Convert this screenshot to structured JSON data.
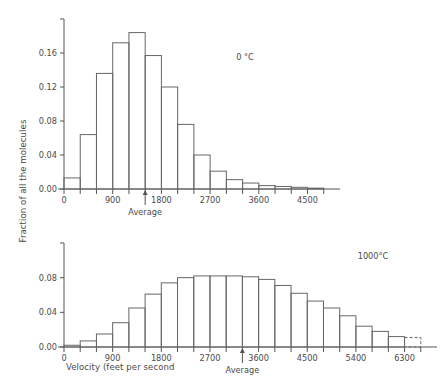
{
  "figure": {
    "ylabel": "Fraction of all the molecules",
    "xlabel": "Velocity (feet per second",
    "axis_color": "#555555",
    "bar_color": "#666666",
    "background": "#ffffff"
  },
  "chart_data": [
    {
      "type": "bar",
      "title": "",
      "annotation": "0 °C",
      "xlabel": "",
      "ylabel": "Fraction of all the molecules",
      "bin_width": 300,
      "xlim": [
        0,
        5100
      ],
      "ylim": [
        0,
        0.2
      ],
      "grid": false,
      "xticks": [
        0,
        900,
        1800,
        2700,
        3600,
        4500
      ],
      "xtick_labels": [
        "0",
        "900",
        "1800",
        "2700",
        "3600",
        "4500"
      ],
      "xminor_ticks": [
        300,
        600,
        1200,
        1500,
        2100,
        2400,
        3000,
        3300,
        3900,
        4200,
        4800
      ],
      "yticks": [
        0.0,
        0.04,
        0.08,
        0.12,
        0.16,
        0.2
      ],
      "ytick_labels": [
        "0.00",
        "0.04",
        "0.08",
        "0.12",
        "0.16",
        ""
      ],
      "categories": [
        "0-300",
        "300-600",
        "600-900",
        "900-1200",
        "1200-1500",
        "1500-1800",
        "1800-2100",
        "2100-2400",
        "2400-2700",
        "2700-3000",
        "3000-3300",
        "3300-3600",
        "3600-3900",
        "3900-4200",
        "4200-4500",
        "4500-4800"
      ],
      "x": [
        0,
        300,
        600,
        900,
        1200,
        1500,
        1800,
        2100,
        2400,
        2700,
        3000,
        3300,
        3600,
        3900,
        4200,
        4500
      ],
      "values": [
        0.013,
        0.064,
        0.136,
        0.172,
        0.184,
        0.157,
        0.12,
        0.076,
        0.04,
        0.021,
        0.011,
        0.007,
        0.004,
        0.003,
        0.002,
        0.001
      ],
      "average_marker": {
        "value": 1500,
        "label": "Average"
      }
    },
    {
      "type": "bar",
      "title": "",
      "annotation": "1000°C",
      "xlabel": "Velocity (feet per second",
      "ylabel": "Fraction of all the molecules",
      "bin_width": 300,
      "xlim": [
        0,
        6900
      ],
      "ylim": [
        0,
        0.12
      ],
      "grid": false,
      "xticks": [
        0,
        900,
        1800,
        2700,
        3600,
        4500,
        5400,
        6300
      ],
      "xtick_labels": [
        "0",
        "900",
        "1800",
        "2700",
        "3600",
        "4500",
        "5400",
        "6300"
      ],
      "xminor_ticks": [
        300,
        600,
        1200,
        1500,
        2100,
        2400,
        3000,
        3300,
        3900,
        4200,
        4800,
        5100,
        5700,
        6000,
        6600
      ],
      "yticks": [
        0.0,
        0.04,
        0.08,
        0.12
      ],
      "ytick_labels": [
        "0.00",
        "0.04",
        "0.08",
        ""
      ],
      "categories": [
        "0-300",
        "300-600",
        "600-900",
        "900-1200",
        "1200-1500",
        "1500-1800",
        "1800-2100",
        "2100-2400",
        "2400-2700",
        "2700-3000",
        "3000-3300",
        "3300-3600",
        "3600-3900",
        "3900-4200",
        "4200-4500",
        "4500-4800",
        "4800-5100",
        "5100-5400",
        "5400-5700",
        "5700-6000",
        "6000-6300",
        "6300-6600"
      ],
      "x": [
        0,
        300,
        600,
        900,
        1200,
        1500,
        1800,
        2100,
        2400,
        2700,
        3000,
        3300,
        3600,
        3900,
        4200,
        4500,
        4800,
        5100,
        5400,
        5700,
        6000,
        6300
      ],
      "values": [
        0.002,
        0.007,
        0.015,
        0.028,
        0.045,
        0.061,
        0.074,
        0.08,
        0.082,
        0.082,
        0.082,
        0.081,
        0.078,
        0.071,
        0.062,
        0.053,
        0.045,
        0.036,
        0.024,
        0.018,
        0.012,
        0.011
      ],
      "dashed_last_bin": true,
      "average_marker": {
        "value": 3300,
        "label": "Average"
      }
    }
  ]
}
